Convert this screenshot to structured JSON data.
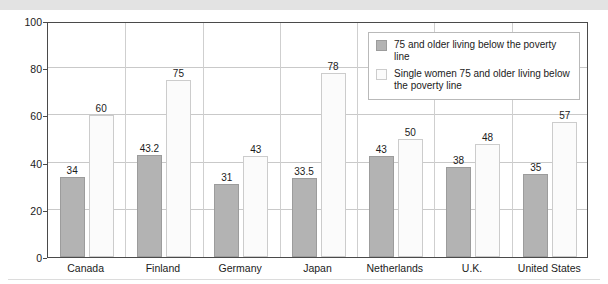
{
  "chart_data": {
    "type": "bar",
    "title": "",
    "xlabel": "",
    "ylabel": "Percent",
    "ylim": [
      0,
      100
    ],
    "ytick_values": [
      0,
      20,
      40,
      60,
      80,
      100
    ],
    "ytick_labels": [
      "0",
      "20",
      "40",
      "60",
      "80",
      "100"
    ],
    "grid": true,
    "legend_position": "upper-right-inside",
    "categories": [
      "Canada",
      "Finland",
      "Germany",
      "Japan",
      "Netherlands",
      "U.K.",
      "United States"
    ],
    "series": [
      {
        "name": "75 and older living below the poverty line",
        "color": "#b3b3b3",
        "values": [
          34,
          43.2,
          31,
          33.5,
          43,
          38,
          35
        ],
        "labels": [
          "34",
          "43.2",
          "31",
          "33.5",
          "43",
          "38",
          "35"
        ]
      },
      {
        "name": "Single women 75 and older living below the poverty line",
        "color": "#fbfbfb",
        "values": [
          60,
          75,
          43,
          78,
          50,
          48,
          57
        ],
        "labels": [
          "60",
          "75",
          "43",
          "78",
          "50",
          "48",
          "57"
        ]
      }
    ]
  }
}
